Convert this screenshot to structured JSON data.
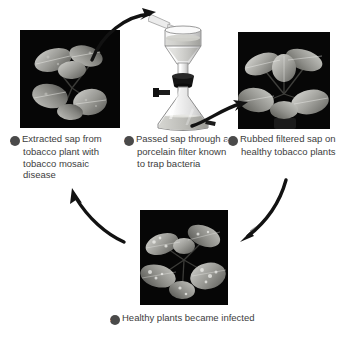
{
  "figure": {
    "background_color": "#ffffff",
    "text_color": "#3d3d3d",
    "badge_color": "#4a4a4a",
    "badge_text_color": "#ffffff",
    "arrow_color": "#111111"
  },
  "steps": [
    {
      "number": "1",
      "text": "Extracted sap from tobacco plant with tobacco mosaic disease",
      "lines": [
        "Extracted sap",
        "from tobacco",
        "plant with",
        "tobacco mosaic",
        "disease"
      ],
      "image": {
        "name": "diseased-tobacco-plant-photo",
        "description": "Grayscale photo of a tobacco plant with mosaic disease on black background",
        "background": "#050505"
      }
    },
    {
      "number": "2",
      "text": "Passed sap through a porcelain filter known to trap bacteria",
      "lines": [
        "Passed sap",
        "through a",
        "porcelain filter",
        "known to trap",
        "bacteria"
      ],
      "image": {
        "name": "porcelain-filter-apparatus-photo",
        "description": "Funnel filter with liquid mounted by a black stopper on a side-arm Erlenmeyer flask containing filtered sap",
        "background": "#ffffff"
      }
    },
    {
      "number": "3",
      "text": "Rubbed filtered sap on healthy tobacco plants",
      "lines": [
        "Rubbed filtered",
        "sap on healthy",
        "tobacco plants"
      ],
      "image": {
        "name": "healthy-tobacco-plant-photo",
        "description": "Grayscale photo of a healthy tobacco plant on black background",
        "background": "#050505"
      }
    },
    {
      "number": "4",
      "text": "Healthy plants became infected",
      "lines": [
        "Healthy plants became",
        "infected"
      ],
      "image": {
        "name": "infected-tobacco-plant-photo",
        "description": "Grayscale photo of a tobacco plant with mottled infected leaves on black background",
        "background": "#050505"
      }
    }
  ],
  "arrows": [
    {
      "name": "arrow-step1-to-step2",
      "from": "1",
      "to": "2",
      "direction": "up-right"
    },
    {
      "name": "arrow-step2-to-step3",
      "from": "2",
      "to": "3",
      "direction": "right"
    },
    {
      "name": "arrow-step3-to-step4",
      "from": "3",
      "to": "4",
      "direction": "down-left"
    },
    {
      "name": "arrow-step4-to-step1",
      "from": "4",
      "to": "1",
      "direction": "up-left"
    }
  ]
}
